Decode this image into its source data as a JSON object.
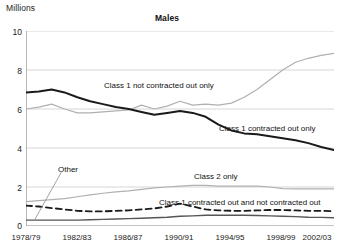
{
  "axis_unit_label": "Millions",
  "title": "Males",
  "chart_data": {
    "type": "line",
    "title": "Males",
    "xlabel": "",
    "ylabel": "Millions",
    "ylim": [
      0,
      10
    ],
    "yticks": [
      "0",
      "2",
      "4",
      "6",
      "8",
      "10"
    ],
    "xticks": [
      "1978/79",
      "1982/83",
      "1986/87",
      "1990/91",
      "1994/95",
      "1998/99",
      "2002/03"
    ],
    "x": [
      "1978/79",
      "1979/80",
      "1980/81",
      "1981/82",
      "1982/83",
      "1983/84",
      "1984/85",
      "1985/86",
      "1986/87",
      "1987/88",
      "1988/89",
      "1989/90",
      "1990/91",
      "1991/92",
      "1992/93",
      "1993/94",
      "1994/95",
      "1995/96",
      "1996/97",
      "1997/98",
      "1998/99",
      "1999/00",
      "2000/01",
      "2001/02",
      "2002/03"
    ],
    "grid": true,
    "legend": "annotations-inline",
    "series": [
      {
        "name": "Class 1 not contracted out only",
        "color": "#b0b0b0",
        "style": "solid",
        "width": 1.2,
        "values": [
          6.0,
          6.1,
          6.25,
          6.0,
          5.8,
          5.8,
          5.85,
          5.9,
          5.95,
          6.2,
          6.0,
          6.15,
          6.4,
          6.2,
          6.25,
          6.2,
          6.3,
          6.6,
          7.0,
          7.5,
          8.0,
          8.4,
          8.6,
          8.75,
          8.85
        ]
      },
      {
        "name": "Class 1 contracted out only",
        "color": "#1a1a1a",
        "style": "solid",
        "width": 2.0,
        "values": [
          6.85,
          6.9,
          7.0,
          6.85,
          6.6,
          6.4,
          6.25,
          6.1,
          6.0,
          5.85,
          5.7,
          5.8,
          5.9,
          5.8,
          5.6,
          5.2,
          4.9,
          4.75,
          4.7,
          4.6,
          4.5,
          4.4,
          4.25,
          4.05,
          3.9
        ]
      },
      {
        "name": "Class 2 only",
        "color": "#b0b0b0",
        "style": "solid",
        "width": 1.2,
        "values": [
          1.25,
          1.3,
          1.35,
          1.4,
          1.5,
          1.6,
          1.68,
          1.75,
          1.8,
          1.88,
          1.95,
          2.0,
          2.05,
          2.08,
          2.08,
          2.05,
          2.05,
          2.05,
          2.05,
          2.0,
          1.92,
          1.9,
          1.9,
          1.9,
          1.9
        ]
      },
      {
        "name": "Class 1 contracted out and not contracted out",
        "color": "#1a1a1a",
        "style": "dashed",
        "width": 1.8,
        "values": [
          1.05,
          1.0,
          0.92,
          0.85,
          0.78,
          0.75,
          0.75,
          0.78,
          0.8,
          0.85,
          0.9,
          1.0,
          1.15,
          1.0,
          0.85,
          0.8,
          0.78,
          0.78,
          0.8,
          0.82,
          0.82,
          0.8,
          0.78,
          0.78,
          0.75
        ]
      },
      {
        "name": "Other",
        "color": "#555555",
        "style": "solid",
        "width": 1.4,
        "values": [
          0.3,
          0.3,
          0.3,
          0.3,
          0.3,
          0.32,
          0.34,
          0.36,
          0.38,
          0.4,
          0.42,
          0.45,
          0.5,
          0.52,
          0.55,
          0.55,
          0.55,
          0.55,
          0.54,
          0.52,
          0.5,
          0.48,
          0.45,
          0.44,
          0.42
        ]
      }
    ],
    "annotations": [
      {
        "name": "Class 1 not contracted out only",
        "text": "Class 1 not contracted out only"
      },
      {
        "name": "Class 1 contracted out only",
        "text": "Class 1 contracted out only"
      },
      {
        "name": "Class 2 only",
        "text": "Class 2 only"
      },
      {
        "name": "Class 1 contracted out and not contracted out",
        "text": "Class 1 contracted out and not contracted out"
      },
      {
        "name": "Other",
        "text": "Other"
      }
    ]
  },
  "annotations": {
    "class1_not_contracted": "Class 1 not contracted out only",
    "class1_contracted": "Class 1 contracted out only",
    "class2_only": "Class 2 only",
    "class1_both": "Class 1 contracted out and not contracted out",
    "other": "Other"
  },
  "yticks": [
    "10",
    "8",
    "6",
    "4",
    "2",
    "0"
  ],
  "xticks": [
    "1978/79",
    "1982/83",
    "1986/87",
    "1990/91",
    "1994/95",
    "1998/99",
    "2002/03"
  ],
  "colors": {
    "grid": "#d6d6d6",
    "axis": "#8a8a8a",
    "dark_line": "#1a1a1a",
    "light_line": "#b0b0b0",
    "other_line": "#555555"
  }
}
